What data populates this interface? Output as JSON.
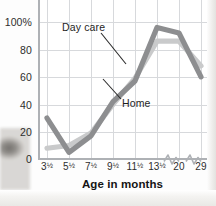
{
  "chart_data": {
    "type": "line",
    "title": "",
    "xlabel": "Age in months",
    "ylabel": "",
    "grid": true,
    "legend_position": "inline-annotation",
    "categories": [
      "3½",
      "5½",
      "7½",
      "9½",
      "11½",
      "13½",
      "20",
      "29"
    ],
    "x_tick_labels": [
      "3½",
      "5½",
      "7½",
      "9½",
      "11½",
      "13½",
      "20",
      "29"
    ],
    "y_tick_labels": [
      "0",
      "20",
      "40",
      "60",
      "80",
      "100%"
    ],
    "y_ticks": [
      0,
      20,
      40,
      60,
      80,
      100
    ],
    "ylim": [
      0,
      108
    ],
    "axis_breaks": [
      "between 13½ and 20",
      "between 20 and 29"
    ],
    "series": [
      {
        "name": "Day care",
        "color": "#c9cacb",
        "values": [
          8,
          10,
          19,
          40,
          59,
          86,
          86,
          68
        ]
      },
      {
        "name": "Home",
        "color": "#8d8e90",
        "values": [
          30,
          5,
          17,
          42,
          57,
          96,
          92,
          60
        ]
      }
    ],
    "annotations": [
      {
        "text": "Day care",
        "series": "Day care"
      },
      {
        "text": "Home",
        "series": "Home"
      }
    ]
  },
  "axis": {
    "x_title": "Age in months",
    "y_tick_0": "0",
    "y_tick_20": "20",
    "y_tick_40": "40",
    "y_tick_60": "60",
    "y_tick_80": "80",
    "y_tick_100": "100%"
  },
  "labels": {
    "day_care": "Day care",
    "home": "Home"
  },
  "colors": {
    "day_care_line": "#c9cacb",
    "home_line": "#8d8e90",
    "grid": "#d7d9dc",
    "axis": "#aeb1b5",
    "text": "#2d2d2d"
  }
}
